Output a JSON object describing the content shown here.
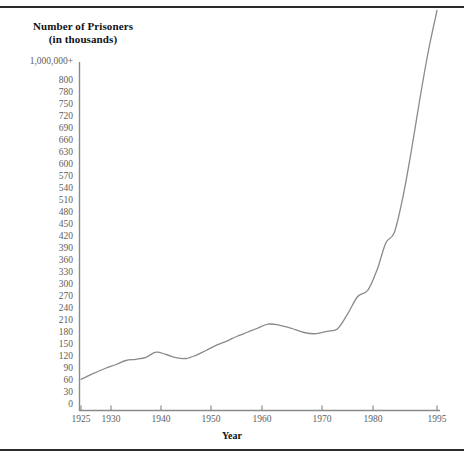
{
  "figure": {
    "title_line1": "Number of Prisoners",
    "title_line2": "(in thousands)",
    "xaxis_title": "Year",
    "line_color": "#8a8a8a",
    "axis_color": "#8a8a8a",
    "tick_text_color": "#5e5e5e",
    "rule_color": "#2b2b2b",
    "background": "#ffffff"
  },
  "chart_data": {
    "type": "line",
    "title": "Number of Prisoners (in thousands)",
    "xlabel": "Year",
    "ylabel": "Number of Prisoners (in thousands)",
    "grid": false,
    "legend": "none",
    "xlim": [
      1925,
      1995
    ],
    "ylim": [
      0,
      830
    ],
    "x_tick_labels": [
      "1925",
      "1930",
      "1940",
      "1950",
      "1960",
      "1970",
      "1980",
      "1995"
    ],
    "x_tick_values": [
      1925,
      1930,
      1940,
      1950,
      1960,
      1970,
      1980,
      1995
    ],
    "y_tick_labels": [
      "1,000,000+",
      "800",
      "780",
      "750",
      "720",
      "690",
      "660",
      "630",
      "600",
      "570",
      "540",
      "510",
      "480",
      "450",
      "420",
      "390",
      "360",
      "330",
      "300",
      "270",
      "240",
      "210",
      "180",
      "150",
      "120",
      "90",
      "60",
      "30",
      "0"
    ],
    "y_tick_values": [
      830,
      800,
      780,
      750,
      720,
      690,
      660,
      630,
      600,
      570,
      540,
      510,
      480,
      450,
      420,
      390,
      360,
      330,
      300,
      270,
      240,
      210,
      180,
      150,
      120,
      90,
      60,
      30,
      0
    ],
    "series": [
      {
        "name": "Number of Prisoners",
        "x": [
          1925,
          1927,
          1929,
          1931,
          1933,
          1935,
          1937,
          1939,
          1941,
          1943,
          1945,
          1947,
          1949,
          1951,
          1953,
          1955,
          1957,
          1959,
          1961,
          1963,
          1965,
          1967,
          1969,
          1971,
          1973,
          1975,
          1977,
          1979,
          1981,
          1983,
          1985,
          1987,
          1989,
          1991,
          1993,
          1995
        ],
        "values": [
          78,
          92,
          105,
          115,
          125,
          128,
          133,
          146,
          140,
          132,
          130,
          138,
          150,
          163,
          173,
          185,
          195,
          205,
          216,
          213,
          205,
          195,
          192,
          198,
          204,
          241,
          285,
          301,
          353,
          419,
          445,
          533,
          650,
          780,
          900,
          1000
        ]
      }
    ],
    "annotations": [
      "Y axis top category is 1,000,000+",
      "X axis spacing is non-uniform: 1925-1930 compressed, 1980-1995 expanded"
    ]
  },
  "y_ticks": [
    {
      "label": "1,000,000+",
      "y": 62
    },
    {
      "label": "800",
      "y": 81
    },
    {
      "label": "780",
      "y": 93
    },
    {
      "label": "750",
      "y": 105
    },
    {
      "label": "720",
      "y": 117
    },
    {
      "label": "690",
      "y": 129
    },
    {
      "label": "660",
      "y": 141
    },
    {
      "label": "630",
      "y": 153
    },
    {
      "label": "600",
      "y": 165
    },
    {
      "label": "570",
      "y": 177
    },
    {
      "label": "540",
      "y": 189
    },
    {
      "label": "510",
      "y": 201
    },
    {
      "label": "480",
      "y": 213
    },
    {
      "label": "450",
      "y": 225
    },
    {
      "label": "420",
      "y": 237
    },
    {
      "label": "390",
      "y": 249
    },
    {
      "label": "360",
      "y": 261
    },
    {
      "label": "330",
      "y": 273
    },
    {
      "label": "300",
      "y": 285
    },
    {
      "label": "270",
      "y": 297
    },
    {
      "label": "240",
      "y": 309
    },
    {
      "label": "210",
      "y": 321
    },
    {
      "label": "180",
      "y": 333
    },
    {
      "label": "150",
      "y": 345
    },
    {
      "label": "120",
      "y": 357
    },
    {
      "label": "90",
      "y": 369
    },
    {
      "label": "60",
      "y": 381
    },
    {
      "label": "30",
      "y": 393
    },
    {
      "label": "0",
      "y": 405
    }
  ],
  "x_ticks": [
    {
      "label": "1925",
      "x": 81
    },
    {
      "label": "1930",
      "x": 111
    },
    {
      "label": "1940",
      "x": 161
    },
    {
      "label": "1950",
      "x": 211
    },
    {
      "label": "1960",
      "x": 262
    },
    {
      "label": "1970",
      "x": 322
    },
    {
      "label": "1980",
      "x": 373
    },
    {
      "label": "1995",
      "x": 437
    }
  ]
}
